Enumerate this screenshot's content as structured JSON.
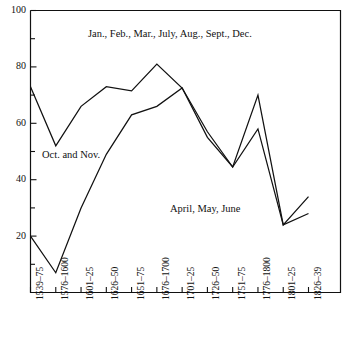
{
  "chart_data": {
    "type": "line",
    "title": "",
    "xlabel": "",
    "ylabel": "",
    "ylim": [
      0,
      100
    ],
    "y_major_ticks": [
      0,
      20,
      40,
      60,
      80,
      100
    ],
    "y_tick_labels": [
      "",
      "20",
      "40",
      "60",
      "80",
      "100"
    ],
    "y_minor_ticks": [
      10,
      30,
      50,
      70,
      90
    ],
    "grid": false,
    "legend_position": "inline-annotations",
    "categories": [
      "1539–75",
      "1576–1600",
      "1601–25",
      "1626–50",
      "1651–75",
      "1676–1700",
      "1701–25",
      "1726–50",
      "1751–75",
      "1776–1800",
      "1801–25",
      "1826–39"
    ],
    "series": [
      {
        "name": "Jan., Feb., Mar., July, Aug., Sept., Dec.",
        "values": [
          73,
          52,
          66,
          73,
          71.5,
          81,
          72.5,
          57,
          44.5,
          70,
          24,
          34
        ]
      },
      {
        "name": "April, May, June / Oct. and Nov.",
        "values": [
          20,
          7,
          30,
          49,
          63,
          66,
          72.5,
          55,
          44.5,
          58,
          24,
          28
        ]
      }
    ],
    "annotations": [
      {
        "id": "ann-top",
        "text": "Jan., Feb., Mar., July, Aug., Sept., Dec."
      },
      {
        "id": "ann-left",
        "text": "Oct. and Nov."
      },
      {
        "id": "ann-mid",
        "text": "April, May, June"
      }
    ],
    "colors": {
      "line": "#111111",
      "axis": "#111111",
      "background": "#ffffff"
    }
  },
  "axis": {
    "y_labels": [
      "100",
      "80",
      "60",
      "40",
      "20"
    ],
    "x_labels": [
      "1539–75",
      "1576–1600",
      "1601–25",
      "1626–50",
      "1651–75",
      "1676–1700",
      "1701–25",
      "1726–50",
      "1751–75",
      "1776–1800",
      "1801–25",
      "1826–39"
    ]
  },
  "annotations": {
    "top": "Jan., Feb., Mar., July, Aug., Sept., Dec.",
    "left": "Oct. and Nov.",
    "mid": "April, May, June"
  }
}
